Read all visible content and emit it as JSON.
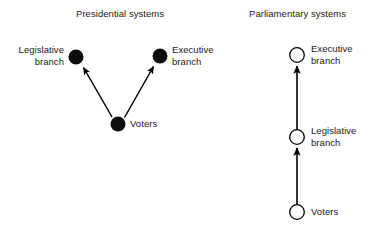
{
  "figure": {
    "width": 375,
    "height": 231,
    "background": "#ffffff",
    "ink_color": "#000000",
    "text_color": "#1a1a1a"
  },
  "panels": [
    {
      "id": "presidential",
      "title": "Presidential systems",
      "node_style": "filled",
      "nodes": [
        {
          "id": "legislative",
          "label": "Legislative\nbranch",
          "label_side": "left",
          "cx": 76,
          "cy": 57,
          "r": 7.5
        },
        {
          "id": "executive",
          "label": "Executive\nbranch",
          "label_side": "right",
          "cx": 160,
          "cy": 56,
          "r": 7.5
        },
        {
          "id": "voters",
          "label": "Voters",
          "label_side": "right",
          "cx": 118,
          "cy": 124,
          "r": 7.5
        }
      ],
      "edges": [
        {
          "from": "voters",
          "to": "legislative",
          "direction": "up-left",
          "arrowhead": "end"
        },
        {
          "from": "voters",
          "to": "executive",
          "direction": "up-right",
          "arrowhead": "end"
        }
      ]
    },
    {
      "id": "parliamentary",
      "title": "Parliamentary systems",
      "node_style": "open",
      "nodes": [
        {
          "id": "executive",
          "label": "Executive\nbranch",
          "label_side": "right",
          "cx": 297,
          "cy": 55,
          "r": 7.5
        },
        {
          "id": "legislative",
          "label": "Legislative\nbranch",
          "label_side": "right",
          "cx": 297,
          "cy": 137,
          "r": 7.5
        },
        {
          "id": "voters",
          "label": "Voters",
          "label_side": "right",
          "cx": 297,
          "cy": 212,
          "r": 7.5
        }
      ],
      "edges": [
        {
          "from": "legislative",
          "to": "executive",
          "direction": "up",
          "arrowhead": "end"
        },
        {
          "from": "voters",
          "to": "legislative",
          "direction": "up",
          "arrowhead": "end"
        }
      ]
    }
  ]
}
